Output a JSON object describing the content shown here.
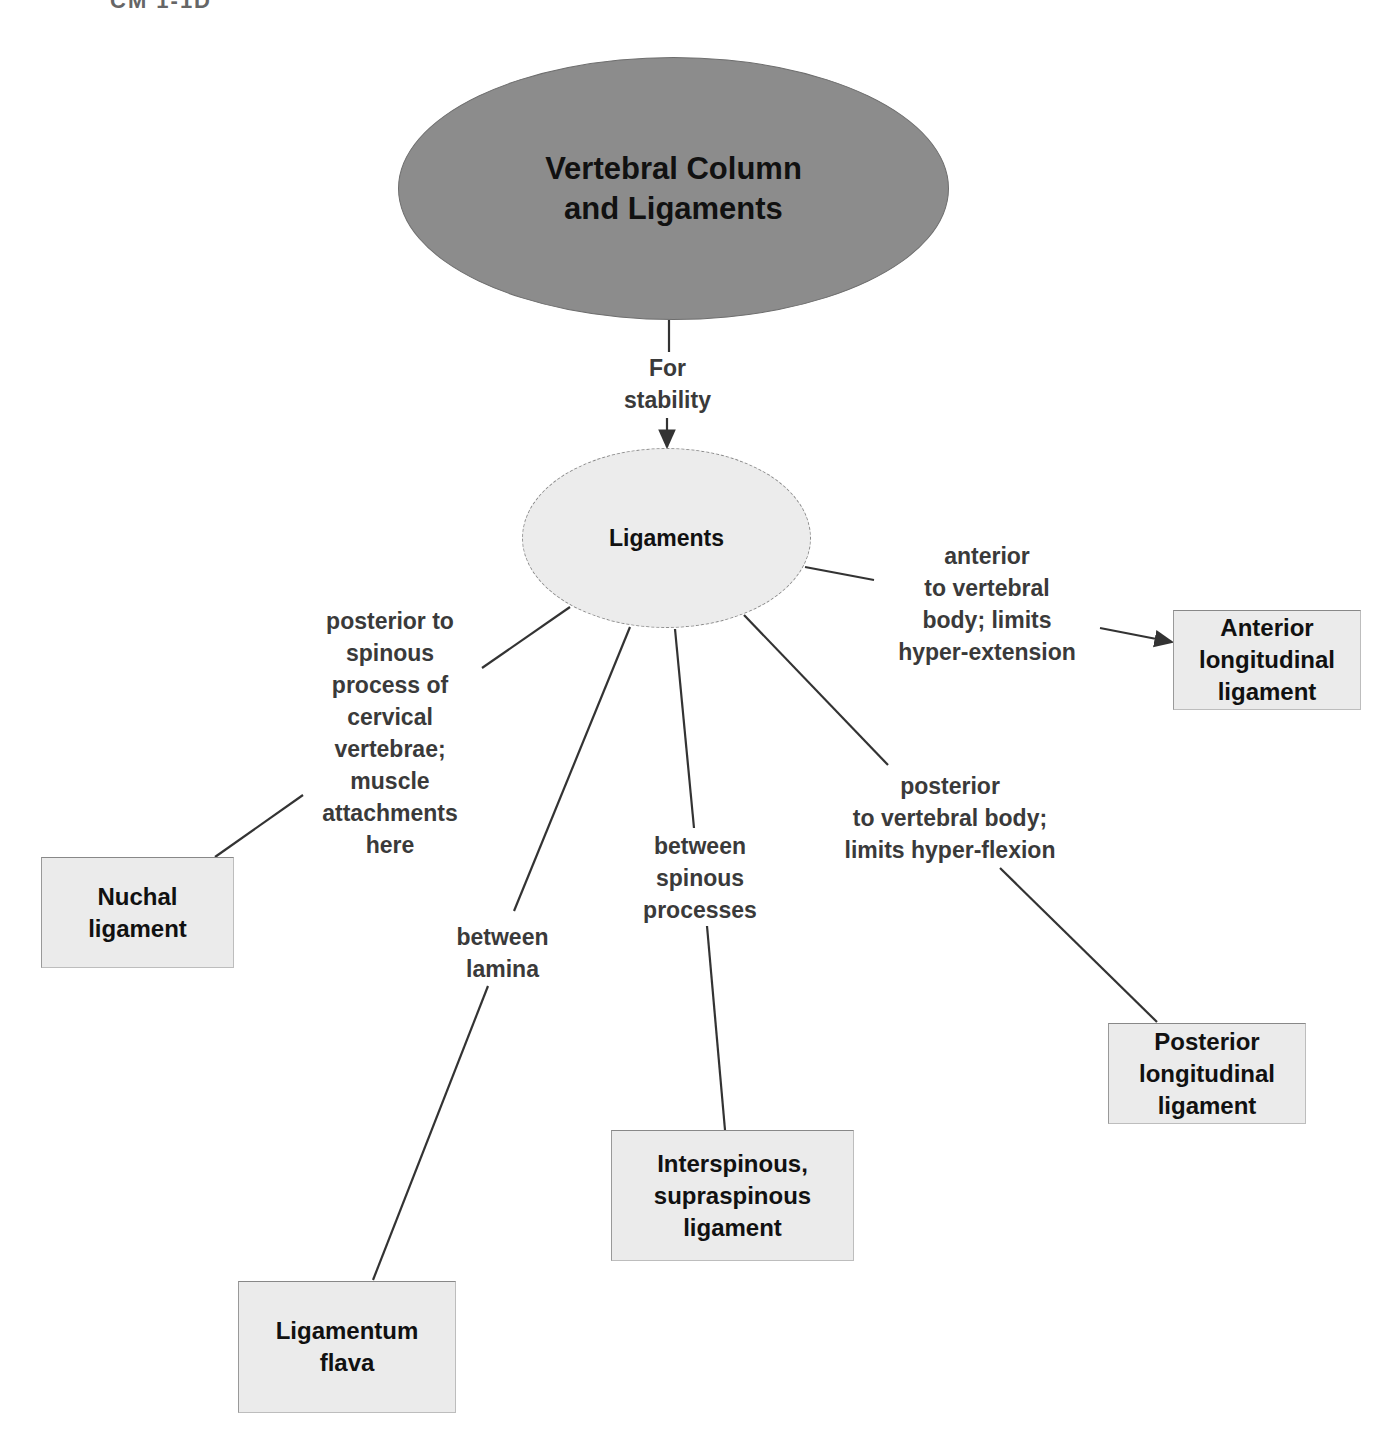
{
  "header": {
    "fragment": "CM 1-1D"
  },
  "root": {
    "label": "Vertebral Column\nand Ligaments"
  },
  "root_edge": {
    "label": "For\nstability"
  },
  "hub": {
    "label": "Ligaments"
  },
  "branches": [
    {
      "edge_label": "anterior\nto vertebral\nbody; limits\nhyper-extension",
      "target": "Anterior\nlongitudinal\nligament"
    },
    {
      "edge_label": "posterior\nto vertebral body;\nlimits hyper-flexion",
      "target": "Posterior\nlongitudinal\nligament"
    },
    {
      "edge_label": "between\nspinous\nprocesses",
      "target": "Interspinous,\nsupraspinous\nligament"
    },
    {
      "edge_label": "between\nlamina",
      "target": "Ligamentum\nflava"
    },
    {
      "edge_label": "posterior to\nspinous\nprocess of\ncervical\nvertebrae;\nmuscle\nattachments\nhere",
      "target": "Nuchal\nligament"
    }
  ],
  "colors": {
    "root_fill": "#8c8c8c",
    "hub_fill": "#ececec",
    "box_fill": "#ebebeb",
    "line": "#333333"
  }
}
